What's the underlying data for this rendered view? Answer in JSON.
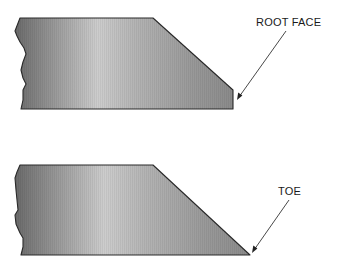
{
  "diagram": {
    "type": "weld-joint-bevel-illustration",
    "plates": [
      {
        "name": "plate-with-root-face",
        "label": "ROOT FACE",
        "edge": "beveled edge ending in a short vertical root face"
      },
      {
        "name": "plate-with-toe",
        "label": "TOE",
        "edge": "beveled edge tapering to a sharp toe point"
      }
    ],
    "colors": {
      "background": "#ffffff",
      "outline": "#2a2a2a",
      "metal_dark": "#6e6e6e",
      "metal_light": "#c9c9c9",
      "text": "#1a1a1a"
    }
  }
}
